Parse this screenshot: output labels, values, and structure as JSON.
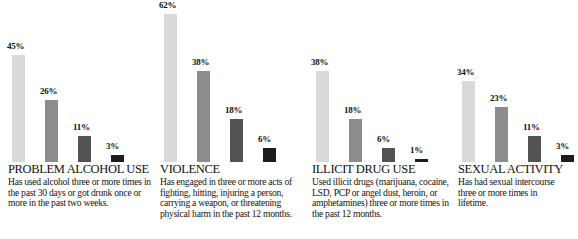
{
  "chart_data": {
    "type": "bar",
    "title": "",
    "xlabel": "",
    "ylabel": "",
    "ylim": [
      0,
      62
    ],
    "grid": false,
    "legend_position": "none",
    "value_suffix": "%",
    "panels": [
      {
        "id": "problem-alcohol-use",
        "title": "PROBLEM ALCOHOL USE",
        "description": "Has used alcohol three or more times in the past 30 days or got drunk once or more in the past two weeks.",
        "values": [
          45,
          26,
          11,
          3
        ],
        "labels": [
          "45%",
          "26%",
          "11%",
          "3%"
        ]
      },
      {
        "id": "violence",
        "title": "VIOLENCE",
        "description": "Has engaged in three or more acts of fighting, hitting, injuring a person, carrying a weapon, or threatening physical harm in the past 12 months.",
        "values": [
          62,
          38,
          18,
          6
        ],
        "labels": [
          "62%",
          "38%",
          "18%",
          "6%"
        ]
      },
      {
        "id": "illicit-drug-use",
        "title": "ILLICIT DRUG USE",
        "description": "Used illicit drugs (marijuana, cocaine, LSD, PCP or angel dust, heroin, or amphetamines) three or more times in the past 12 months.",
        "values": [
          38,
          18,
          6,
          1
        ],
        "labels": [
          "38%",
          "18%",
          "6%",
          "1%"
        ]
      },
      {
        "id": "sexual-activity",
        "title": "SEXUAL ACTIVITY",
        "description": "Has had sexual intercourse three or more times in lifetime.",
        "values": [
          34,
          23,
          11,
          3
        ],
        "labels": [
          "34%",
          "23%",
          "11%",
          "3%"
        ]
      }
    ],
    "series_colors": [
      "#d9d9d9",
      "#8c8c8c",
      "#535353",
      "#1c1c1c"
    ]
  }
}
